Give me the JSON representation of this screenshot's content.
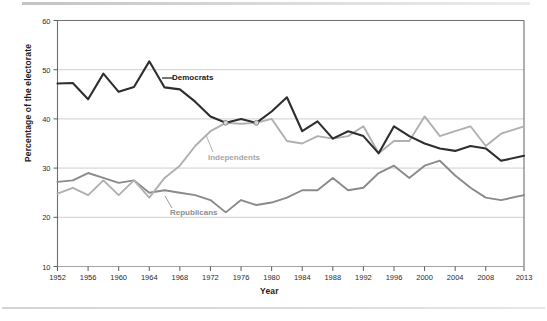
{
  "chart_data": {
    "type": "line",
    "title": "",
    "xlabel": "Year",
    "ylabel": "Percentage of the electorate",
    "xlim": [
      1952,
      2013
    ],
    "ylim": [
      10,
      60
    ],
    "yticks": [
      10,
      20,
      30,
      40,
      50,
      60
    ],
    "xticks": [
      1952,
      1956,
      1960,
      1964,
      1968,
      1972,
      1976,
      1980,
      1984,
      1988,
      1992,
      1996,
      2000,
      2004,
      2008,
      2013
    ],
    "grid": "horizontal",
    "legend_position": "inline-annotations",
    "x": [
      1952,
      1954,
      1956,
      1958,
      1960,
      1962,
      1964,
      1966,
      1968,
      1970,
      1972,
      1974,
      1976,
      1978,
      1980,
      1982,
      1984,
      1986,
      1988,
      1990,
      1992,
      1994,
      1996,
      1998,
      2000,
      2002,
      2004,
      2006,
      2008,
      2010,
      2013
    ],
    "series": [
      {
        "name": "Democrats",
        "color": "#2e2e2e",
        "label": "Democrats",
        "values": [
          47.2,
          47.3,
          44.0,
          49.2,
          45.5,
          46.5,
          51.7,
          46.4,
          46.0,
          43.5,
          40.5,
          39.2,
          40.0,
          39.2,
          41.5,
          44.4,
          37.5,
          39.5,
          36.0,
          37.5,
          36.5,
          33.0,
          38.5,
          36.5,
          35.0,
          34.0,
          33.5,
          34.5,
          34.0,
          31.5,
          32.5
        ]
      },
      {
        "name": "Independents",
        "color": "#b0b0b0",
        "label": "Independents",
        "values": [
          24.8,
          26.0,
          24.5,
          27.5,
          24.5,
          27.5,
          24.0,
          28.0,
          30.5,
          34.5,
          37.5,
          39.2,
          39.0,
          39.2,
          40.0,
          35.5,
          35.0,
          36.5,
          36.0,
          36.5,
          38.5,
          33.0,
          35.5,
          35.5,
          40.5,
          36.5,
          37.5,
          38.5,
          34.5,
          37.0,
          38.5
        ]
      },
      {
        "name": "Republicans",
        "color": "#8a8a8a",
        "label": "Republicans",
        "values": [
          27.2,
          27.5,
          29.0,
          28.0,
          27.0,
          27.5,
          25.0,
          25.5,
          25.0,
          24.5,
          23.5,
          21.0,
          23.5,
          22.5,
          23.0,
          24.0,
          25.5,
          25.5,
          28.0,
          25.5,
          26.0,
          29.0,
          30.5,
          28.0,
          30.5,
          31.5,
          28.5,
          26.0,
          24.0,
          23.5,
          24.5
        ]
      }
    ],
    "markers": [
      {
        "x": 1974,
        "y": 39.2,
        "series": "crossover"
      },
      {
        "x": 1978,
        "y": 39.2,
        "series": "crossover"
      }
    ],
    "annotations": [
      {
        "text": "Democrats",
        "x_px": 172,
        "y_px": 78
      },
      {
        "text": "Independents",
        "x_px": 208,
        "y_px": 158
      },
      {
        "text": "Republicans",
        "x_px": 170,
        "y_px": 213
      }
    ]
  },
  "axes": {
    "ylabel": "Percentage of the electorate",
    "xlabel": "Year",
    "ytick_labels": [
      "60",
      "50",
      "40",
      "30",
      "20",
      "10"
    ],
    "xtick_labels": [
      "1952",
      "1956",
      "1960",
      "1964",
      "1968",
      "1972",
      "1976",
      "1980",
      "1984",
      "1988",
      "1992",
      "1996",
      "2000",
      "2004",
      "2008",
      "2013"
    ]
  },
  "footer": {
    "ghost_text": ""
  }
}
